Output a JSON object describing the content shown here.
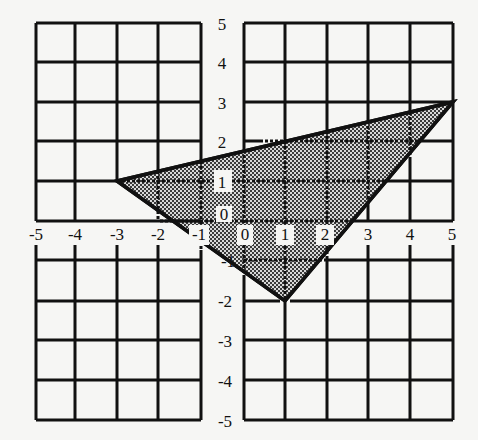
{
  "figure": {
    "type": "coordinate-grid-triangle",
    "x_range": [
      -5,
      5
    ],
    "y_range": [
      -5,
      5
    ],
    "x_ticks": [
      "-5",
      "-4",
      "-3",
      "-2",
      "-1",
      "0",
      "1",
      "2",
      "3",
      "4",
      "5"
    ],
    "y_ticks": [
      "5",
      "4",
      "3",
      "2",
      "1",
      "0",
      "-1",
      "-2",
      "-3",
      "-4",
      "-5"
    ],
    "triangle": {
      "vertices": [
        [
          -3,
          1
        ],
        [
          5,
          3
        ],
        [
          1,
          -2
        ]
      ],
      "fill": "crosshatch-gray"
    },
    "colors": {
      "grid": "#111111",
      "background": "#f6f6f4",
      "fill_dark": "#3a3a3a",
      "fill_light": "#d8d8d8"
    }
  }
}
